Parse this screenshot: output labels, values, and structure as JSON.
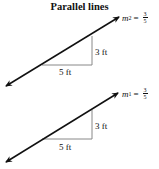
{
  "title": "Parallel lines",
  "lines": [
    {
      "id": "top",
      "slope_label": "m",
      "slope_sub": "2",
      "equals": "=",
      "numerator": "3",
      "denominator": "5",
      "rise_label": "3 ft",
      "run_label": "5 ft"
    },
    {
      "id": "bottom",
      "slope_label": "m",
      "slope_sub": "1",
      "equals": "=",
      "numerator": "3",
      "denominator": "5",
      "rise_label": "3 ft",
      "run_label": "5 ft"
    }
  ],
  "colors": {
    "line": "#111111",
    "triangle": "#888888"
  }
}
